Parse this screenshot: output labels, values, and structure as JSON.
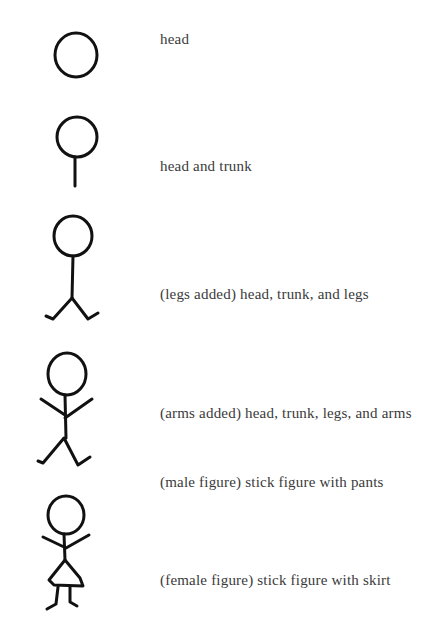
{
  "diagram": {
    "steps": [
      {
        "id": "head",
        "caption": "head",
        "caption_y": 31
      },
      {
        "id": "head-trunk",
        "caption": "head and trunk",
        "caption_y": 158
      },
      {
        "id": "legs",
        "caption": "(legs added) head, trunk, and legs",
        "caption_y": 286
      },
      {
        "id": "arms",
        "caption": "(arms added) head, trunk, legs, and arms",
        "caption_y": 405
      },
      {
        "id": "male",
        "caption": "(male figure) stick figure with pants",
        "caption_y": 474
      },
      {
        "id": "female",
        "caption": "(female figure) stick figure with skirt",
        "caption_y": 572
      }
    ],
    "stroke_color": "#111111",
    "text_color": "#3a3a3a"
  }
}
